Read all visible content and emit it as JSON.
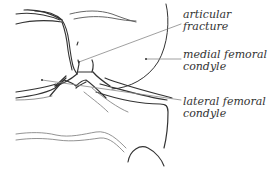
{
  "diagram": {
    "type": "anatomical line drawing",
    "colors": {
      "line": "#333333",
      "leader": "#888888",
      "text": "#333333",
      "background": "#ffffff"
    },
    "labels": [
      {
        "id": "articular-fracture",
        "line1": "articular",
        "line2": "fracture"
      },
      {
        "id": "medial-femoral-condyle",
        "line1": "medial femoral",
        "line2": "condyle"
      },
      {
        "id": "lateral-femoral-condyle",
        "line1": "lateral femoral",
        "line2": "condyle"
      }
    ]
  }
}
